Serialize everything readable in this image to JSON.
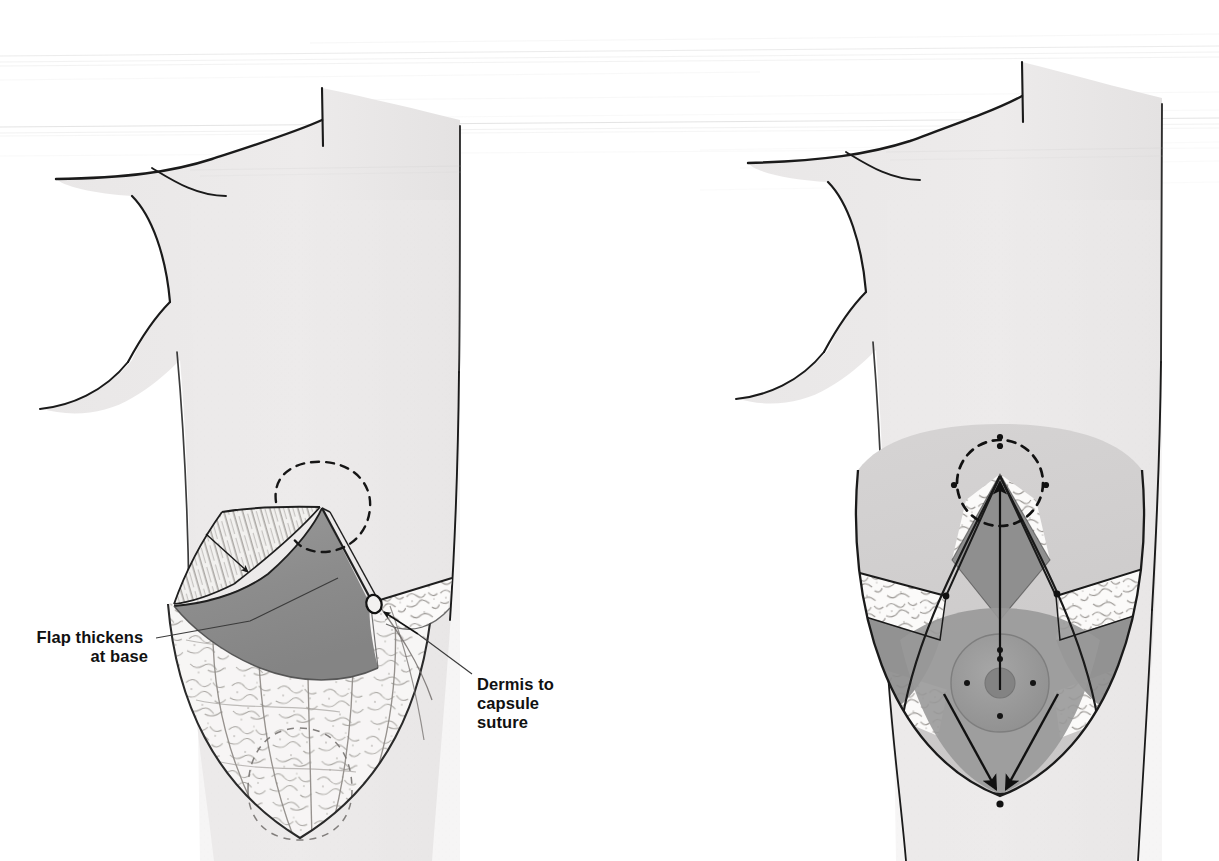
{
  "figure": {
    "kind": "medical-surgical-illustration",
    "background_color": "#ffffff",
    "width": 1219,
    "height": 861,
    "scan_artifacts": true
  },
  "palette": {
    "ink": "#1a1a1a",
    "ink_soft": "#3b3b3b",
    "skin": "#eceaea",
    "skin_shadow": "#e2e0e0",
    "flap_gray": "#8e8e8e",
    "flap_gray_dark": "#7e7e7e",
    "flap_gray_light": "#a6a6a6",
    "parenchyma": "#f6f5f4",
    "areola": "#9a9a9a",
    "nipple": "#8a8a8a",
    "dashed_marking": "#1a1a1a",
    "label_text": "#111111",
    "leader_line": "#3b3b3b"
  },
  "panels": [
    {
      "id": "left-panel",
      "name": "Left panel: dermal flap elevated, lateral view of flap base and suture",
      "position": "left",
      "torso_view": "anterior oblique torso with right breast dissected"
    },
    {
      "id": "right-panel",
      "name": "Right panel: flap inset with nipple-areola transposition vectors",
      "position": "right",
      "torso_view": "anterior torso with breast mound and arrows"
    }
  ],
  "annotations": [
    {
      "id": "flap-thickens",
      "lines": [
        "Flap thickens",
        "at base"
      ],
      "text_anchor": "end",
      "text_x": 148,
      "text_y": 643,
      "line_height": 19,
      "leader": "M 156 638 L 250 621 L 338 578",
      "panel": "left-panel"
    },
    {
      "id": "dermis-to-capsule-suture",
      "lines": [
        "Dermis to",
        "capsule",
        "suture"
      ],
      "text_anchor": "start",
      "text_x": 477,
      "text_y": 690,
      "line_height": 19,
      "leader": "M 472 674 L 418 634 L 378 610",
      "panel": "left-panel"
    }
  ],
  "markings": {
    "left_panel": {
      "dashed_areola_circle": "new nipple-areola position outline",
      "dashed_implant_circle": "implant position outline at lower pole",
      "suture_knot": "dermis-to-capsule suture point",
      "flap_arrow": "arrow indicating flap thickening direction"
    },
    "right_panel": {
      "dashed_areola_circle": "new areola site with four registration dots",
      "up_arrow": "nipple-areola elevation vector",
      "down_arrows": [
        "medial pillar closure vector",
        "lateral pillar closure vector"
      ],
      "registration_dots": 4,
      "nipple_dots": 4
    }
  },
  "textures": {
    "dermis_striations": "fine parallel striations on flap underside",
    "fat_lobules": "stippled lobular breast parenchyma",
    "cut_edge": "irregular cut fatty tissue band"
  }
}
